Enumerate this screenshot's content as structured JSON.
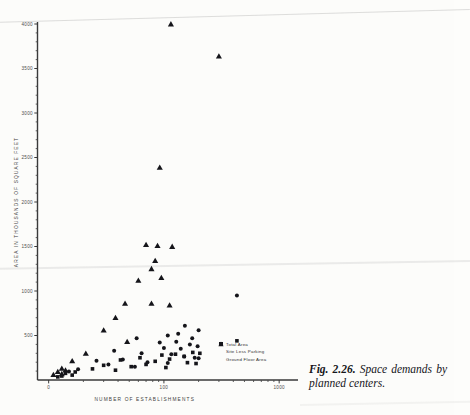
{
  "figure": {
    "caption_label": "Fig. 2.26.",
    "caption_text": "Space demands by planned centers."
  },
  "legend": {
    "position": "inside-lower-right",
    "items": [
      {
        "glyph": "triangle-marker-icon",
        "label": "Total Area"
      },
      {
        "glyph": "circle-marker-icon",
        "label": "Site Less Parking"
      },
      {
        "glyph": "square-marker-icon",
        "label": "Ground Floor Area"
      }
    ]
  },
  "chart_data": {
    "type": "scatter",
    "title": "",
    "xlabel": "NUMBER OF ESTABLISHMENTS",
    "ylabel": "AREA IN THOUSANDS OF SQUARE FEET",
    "xscale": "log",
    "yscale": "linear",
    "xlim": [
      8,
      1400
    ],
    "ylim": [
      0,
      4000
    ],
    "grid": false,
    "xticklabels": [
      "0",
      "100",
      "1000"
    ],
    "xtickvalues": [
      10,
      100,
      1000
    ],
    "yticklabels": [
      "500",
      "1000",
      "1500",
      "2000",
      "2500",
      "3000",
      "3500",
      "4000"
    ],
    "ytickvalues": [
      500,
      1000,
      1500,
      2000,
      2500,
      3000,
      3500,
      4000
    ],
    "series": [
      {
        "name": "Total Area",
        "marker": "triangle",
        "points": [
          [
            115,
            4000
          ],
          [
            300,
            3640
          ],
          [
            92,
            2390
          ],
          [
            70,
            1520
          ],
          [
            88,
            1510
          ],
          [
            118,
            1500
          ],
          [
            84,
            1340
          ],
          [
            78,
            1250
          ],
          [
            95,
            1150
          ],
          [
            60,
            1120
          ],
          [
            46,
            860
          ],
          [
            78,
            860
          ],
          [
            112,
            840
          ],
          [
            38,
            700
          ],
          [
            30,
            560
          ],
          [
            48,
            430
          ],
          [
            21,
            300
          ],
          [
            16,
            215
          ],
          [
            13,
            130
          ],
          [
            14,
            110
          ],
          [
            12,
            95
          ],
          [
            13,
            70
          ],
          [
            11,
            60
          ]
        ]
      },
      {
        "name": "Site Less Parking",
        "marker": "circle",
        "points": [
          [
            430,
            950
          ],
          [
            152,
            610
          ],
          [
            200,
            560
          ],
          [
            133,
            520
          ],
          [
            108,
            500
          ],
          [
            176,
            470
          ],
          [
            58,
            470
          ],
          [
            128,
            430
          ],
          [
            92,
            420
          ],
          [
            168,
            400
          ],
          [
            196,
            380
          ],
          [
            100,
            360
          ],
          [
            140,
            350
          ],
          [
            37,
            330
          ],
          [
            64,
            300
          ],
          [
            116,
            290
          ],
          [
            150,
            265
          ],
          [
            185,
            250
          ],
          [
            200,
            245
          ],
          [
            44,
            230
          ],
          [
            26,
            215
          ],
          [
            72,
            200
          ],
          [
            108,
            190
          ],
          [
            33,
            175
          ],
          [
            56,
            150
          ],
          [
            18,
            120
          ],
          [
            15,
            95
          ]
        ]
      },
      {
        "name": "Ground Floor Area",
        "marker": "square",
        "points": [
          [
            430,
            440
          ],
          [
            178,
            310
          ],
          [
            205,
            300
          ],
          [
            126,
            290
          ],
          [
            96,
            280
          ],
          [
            150,
            265
          ],
          [
            62,
            250
          ],
          [
            112,
            235
          ],
          [
            42,
            225
          ],
          [
            84,
            210
          ],
          [
            160,
            195
          ],
          [
            190,
            185
          ],
          [
            70,
            175
          ],
          [
            30,
            165
          ],
          [
            52,
            150
          ],
          [
            104,
            140
          ],
          [
            24,
            125
          ],
          [
            38,
            110
          ],
          [
            17,
            90
          ],
          [
            14,
            75
          ],
          [
            16,
            55
          ],
          [
            13,
            45
          ],
          [
            12,
            35
          ]
        ]
      }
    ]
  }
}
